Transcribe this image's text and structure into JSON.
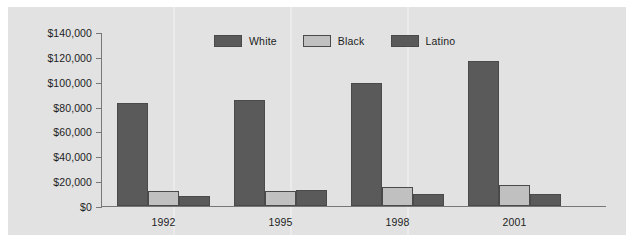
{
  "chart_data": {
    "type": "bar",
    "title": "",
    "subtitle": "",
    "xlabel": "",
    "ylabel": "",
    "categories": [
      "1992",
      "1995",
      "1998",
      "2001"
    ],
    "series": [
      {
        "name": "White",
        "color": "#5a5a5a",
        "values": [
          83000,
          85000,
          99000,
          117000
        ]
      },
      {
        "name": "Black",
        "color": "#c0c0c0",
        "values": [
          12000,
          12000,
          15000,
          17000
        ]
      },
      {
        "name": "Latino",
        "color": "#5a5a5a",
        "values": [
          8000,
          13000,
          10000,
          10000
        ]
      }
    ],
    "ylim": [
      0,
      140000
    ],
    "ytick_values": [
      0,
      20000,
      40000,
      60000,
      80000,
      100000,
      120000,
      140000
    ],
    "ytick_labels": [
      "$0",
      "$20,000",
      "$40,000",
      "$60,000",
      "$80,000",
      "$100,000",
      "$120,000",
      "$140,000"
    ],
    "grid": false,
    "legend_position": "top-center",
    "annotations": []
  },
  "figure": {
    "background_color": "#e2e2e2",
    "axis_color": "#777777",
    "text_color": "#1d1d1d"
  }
}
